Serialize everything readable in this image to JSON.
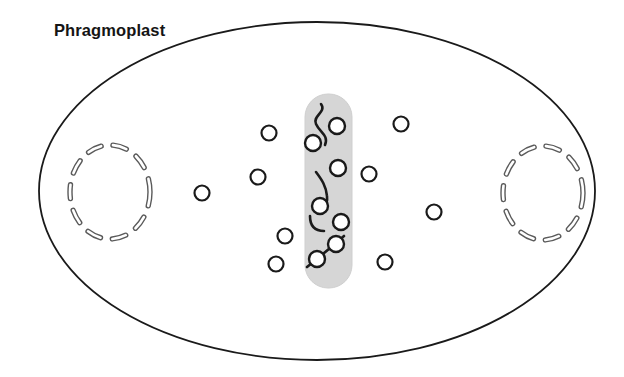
{
  "figure": {
    "title": "Phragmoplast",
    "type": "cell-division-diagram"
  },
  "colors": {
    "outline": "#1a1a1a",
    "phragmoplast_band": "#d6d6d6",
    "band_edge": "#c9c9c9",
    "nucleus_dash": "#5b5b5b",
    "nucleus_dash_fill": "#ffffff",
    "vesicle_stroke": "#1a1a1a",
    "vesicle_fill": "#ffffff",
    "microtubule": "#1a1a1a",
    "background": "#ffffff"
  },
  "cell_membrane": {
    "shape": "ellipse",
    "cx": 317,
    "cy": 191,
    "rx": 278,
    "ry": 169,
    "stroke_width": 1.8
  },
  "phragmoplast_band": {
    "shape": "rounded-rect",
    "x": 305,
    "y": 94,
    "width": 47,
    "height": 194,
    "radius": 23
  },
  "nuclei": [
    {
      "name": "daughter-nucleus-left",
      "cx": 110,
      "cy": 192,
      "rx": 40,
      "ry": 47,
      "dash": "14 12",
      "stroke_width": 5
    },
    {
      "name": "daughter-nucleus-right",
      "cx": 543,
      "cy": 193,
      "rx": 40,
      "ry": 47,
      "dash": "14 12",
      "stroke_width": 5
    }
  ],
  "vesicles_outside": [
    {
      "cx": 269,
      "cy": 133,
      "r": 7.5
    },
    {
      "cx": 258,
      "cy": 177,
      "r": 7.5
    },
    {
      "cx": 202,
      "cy": 193,
      "r": 7.5
    },
    {
      "cx": 285,
      "cy": 236,
      "r": 7.5
    },
    {
      "cx": 276,
      "cy": 264,
      "r": 7.5
    },
    {
      "cx": 401,
      "cy": 124,
      "r": 7.5
    },
    {
      "cx": 369,
      "cy": 174,
      "r": 7.5
    },
    {
      "cx": 434,
      "cy": 212,
      "r": 7.5
    },
    {
      "cx": 385,
      "cy": 262,
      "r": 7.5
    }
  ],
  "vesicles_in_band": [
    {
      "cx": 337,
      "cy": 126,
      "r": 8
    },
    {
      "cx": 313,
      "cy": 143,
      "r": 8
    },
    {
      "cx": 338,
      "cy": 168,
      "r": 8
    },
    {
      "cx": 320,
      "cy": 206,
      "r": 8
    },
    {
      "cx": 341,
      "cy": 222,
      "r": 8
    },
    {
      "cx": 336,
      "cy": 244,
      "r": 8
    },
    {
      "cx": 317,
      "cy": 259,
      "r": 8
    }
  ],
  "microtubules": [
    {
      "name": "microtubule-upper-s",
      "d": "M 321 104 C 327 112, 312 116, 316 124 C 320 133, 329 135, 325 145"
    },
    {
      "name": "microtubule-mid-hook",
      "d": "M 316 172 C 322 180, 326 186, 327 196 C 328 203, 325 207, 322 210"
    },
    {
      "name": "microtubule-lower-hook",
      "d": "M 310 216 C 310 226, 315 231, 324 231"
    },
    {
      "name": "microtubule-diagonal",
      "d": "M 307 267 C 318 258, 333 246, 344 236"
    }
  ],
  "counts": {
    "vesicles_total": 16,
    "nuclei": 2,
    "microtubule_strands": 4
  }
}
